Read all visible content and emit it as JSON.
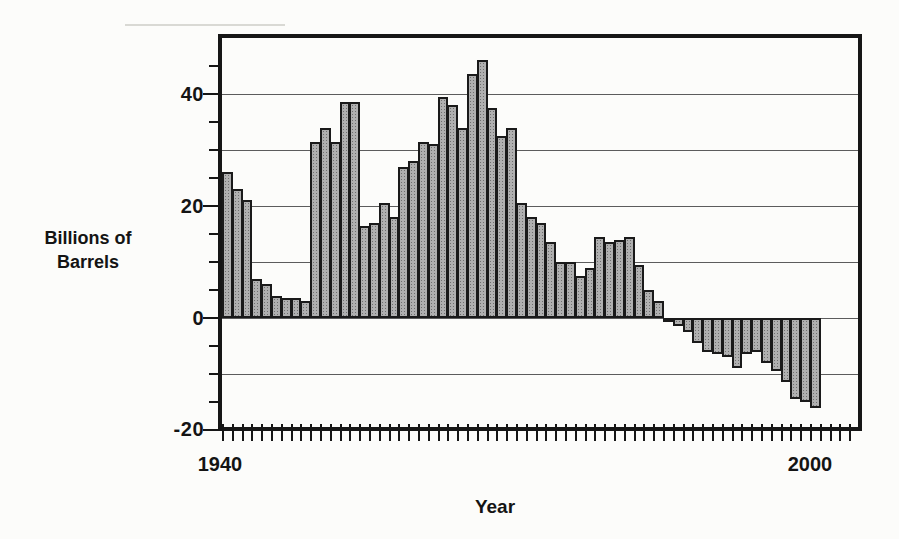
{
  "labels": {
    "y_title_line1": "Billions of",
    "y_title_line2": "Barrels",
    "x_title": "Year",
    "y_ticks": [
      "40",
      "20",
      "0",
      "-20"
    ],
    "x_ticks": [
      "1940",
      "2000"
    ]
  },
  "style": {
    "bar_fill": "#b0b0b0",
    "bar_stipple": "#6f6f6f",
    "bar_border": "#1a1a1a",
    "frame_color": "#161616",
    "grid_color": "#5c5c5c",
    "background": "#fcfcfa"
  },
  "chart_data": {
    "type": "bar",
    "title": "",
    "xlabel": "Year",
    "ylabel": "Billions of Barrels",
    "xlim": [
      1940,
      2005
    ],
    "ylim": [
      -20,
      50
    ],
    "grid": true,
    "y_gridlines": [
      40,
      30,
      20,
      10,
      0,
      -10
    ],
    "y_major_ticks": [
      40,
      20,
      0,
      -20
    ],
    "y_minor_ticks": [
      45,
      35,
      30,
      25,
      15,
      10,
      5,
      -5,
      -10,
      -15
    ],
    "x_tick_every_year": true,
    "x_labeled_ticks": [
      1940,
      2000
    ],
    "years": [
      1940,
      1941,
      1942,
      1943,
      1944,
      1945,
      1946,
      1947,
      1948,
      1949,
      1950,
      1951,
      1952,
      1953,
      1954,
      1955,
      1956,
      1957,
      1958,
      1959,
      1960,
      1961,
      1962,
      1963,
      1964,
      1965,
      1966,
      1967,
      1968,
      1969,
      1970,
      1971,
      1972,
      1973,
      1974,
      1975,
      1976,
      1977,
      1978,
      1979,
      1980,
      1981,
      1982,
      1983,
      1984,
      1985,
      1986,
      1987,
      1988,
      1989,
      1990,
      1991,
      1992,
      1993,
      1994,
      1995,
      1996,
      1997,
      1998,
      1999,
      2000
    ],
    "values": [
      26,
      23,
      21,
      7,
      6,
      4,
      3.5,
      3.5,
      3,
      31.5,
      34,
      31.5,
      38.5,
      38.5,
      16.5,
      17,
      20.5,
      18,
      27,
      28,
      31.5,
      31,
      39.5,
      38,
      34,
      43.5,
      46,
      37.5,
      32.5,
      34,
      20.5,
      18,
      17,
      13.5,
      10,
      10,
      7.5,
      9,
      14.5,
      13.5,
      14,
      14.5,
      9.5,
      5,
      3,
      -0.5,
      -1.5,
      -2.5,
      -4.5,
      -6,
      -6.5,
      -7,
      -9,
      -6.5,
      -6,
      -8,
      -9.5,
      -11.5,
      -14.5,
      -15,
      -16
    ]
  }
}
